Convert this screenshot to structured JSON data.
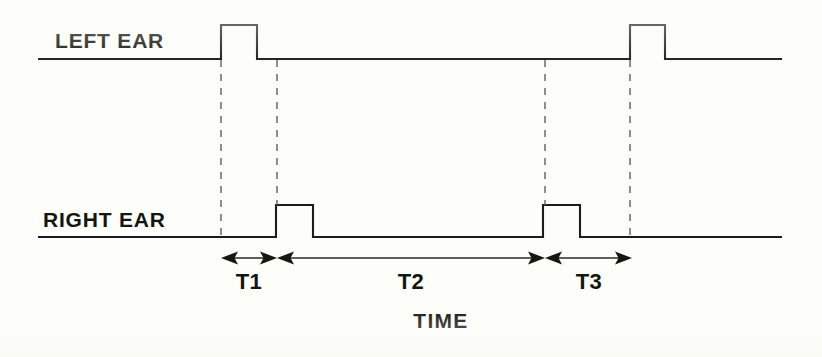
{
  "figure": {
    "title_visible": false,
    "background_color": "#fdfdfa",
    "ink_color": "#1c1c1a",
    "guide_color": "#6b6b63"
  },
  "labels": {
    "left_channel": "LEFT EAR",
    "right_channel": "RIGHT EAR",
    "axis_label": "TIME",
    "interval_1": "T1",
    "interval_2": "T2",
    "interval_3": "T3"
  },
  "chart_data": {
    "type": "line",
    "title": "",
    "xlabel": "TIME",
    "ylabel": "",
    "grid": false,
    "legend": "none",
    "series": [
      {
        "name": "LEFT EAR",
        "baseline_y_px": 59,
        "pulse_top_y_px": 25,
        "x_start_px": 38,
        "x_end_px": 782,
        "pulses": [
          {
            "index": 1,
            "rise_px": 221,
            "fall_px": 257
          },
          {
            "index": 2,
            "rise_px": 630,
            "fall_px": 665
          }
        ]
      },
      {
        "name": "RIGHT EAR",
        "baseline_y_px": 237,
        "pulse_top_y_px": 205,
        "x_start_px": 38,
        "x_end_px": 782,
        "pulses": [
          {
            "index": 1,
            "rise_px": 276,
            "fall_px": 313
          },
          {
            "index": 2,
            "rise_px": 543,
            "fall_px": 580
          }
        ]
      }
    ],
    "guides": [
      {
        "name": "left-pulse1-rise",
        "x_px": 221,
        "y_top_px": 60,
        "y_bottom_px": 237
      },
      {
        "name": "right-pulse1-rise",
        "x_px": 277,
        "y_top_px": 60,
        "y_bottom_px": 205
      },
      {
        "name": "right-pulse2-rise",
        "x_px": 545,
        "y_top_px": 60,
        "y_bottom_px": 205
      },
      {
        "name": "left-pulse2-rise",
        "x_px": 630,
        "y_top_px": 60,
        "y_bottom_px": 237
      }
    ],
    "intervals": [
      {
        "label": "T1",
        "from_px": 221,
        "to_px": 277,
        "y_px": 258,
        "label_x_px": 249,
        "label_y_px": 289
      },
      {
        "label": "T2",
        "from_px": 277,
        "to_px": 545,
        "y_px": 258,
        "label_x_px": 411,
        "label_y_px": 289
      },
      {
        "label": "T3",
        "from_px": 545,
        "to_px": 632,
        "y_px": 258,
        "label_x_px": 589,
        "label_y_px": 289
      }
    ],
    "annotations": [
      {
        "text": "LEFT EAR",
        "x_px": 55,
        "y_px": 48
      },
      {
        "text": "RIGHT EAR",
        "x_px": 43,
        "y_px": 227
      },
      {
        "text": "TIME",
        "x_px": 441,
        "y_px": 328
      }
    ]
  }
}
